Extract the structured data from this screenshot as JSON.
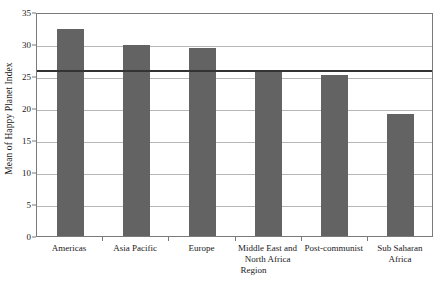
{
  "chart_data": {
    "type": "bar",
    "title": "",
    "xlabel": "Region",
    "ylabel": "Mean of Happy Planet Index",
    "categories": [
      "Americas",
      "Asia Pacific",
      "Europe",
      "Middle East and North Africa",
      "Post-communist",
      "Sub Saharan Africa"
    ],
    "values": [
      32.3,
      29.8,
      29.4,
      25.6,
      25.1,
      19.0
    ],
    "ylim": [
      0,
      35
    ],
    "yticks": [
      0,
      5,
      10,
      15,
      20,
      25,
      30,
      35
    ],
    "ytick_labels": [
      "0",
      "5",
      "10",
      "15",
      "20",
      "25",
      "30",
      "35"
    ],
    "grid": true,
    "legend": "none",
    "bar_color": "#636363",
    "reference_line": {
      "value": 26.2,
      "color": "#333333",
      "label": ""
    }
  }
}
